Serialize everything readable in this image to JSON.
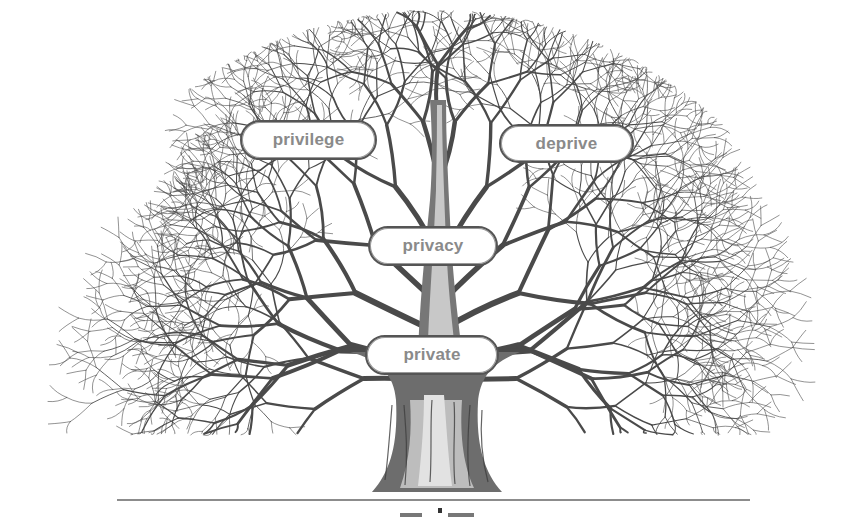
{
  "diagram": {
    "type": "word-family-tree",
    "labels": {
      "privilege": "privilege",
      "deprive": "deprive",
      "privacy": "privacy",
      "private": "private"
    },
    "nodes": [
      {
        "id": "privilege",
        "text": "privilege",
        "x": 240,
        "y": 120,
        "w": 137,
        "h": 40
      },
      {
        "id": "deprive",
        "text": "deprive",
        "x": 499,
        "y": 124,
        "w": 135,
        "h": 39
      },
      {
        "id": "privacy",
        "text": "privacy",
        "x": 368,
        "y": 226,
        "w": 130,
        "h": 40
      },
      {
        "id": "private",
        "text": "private",
        "x": 365,
        "y": 335,
        "w": 134,
        "h": 40
      }
    ],
    "colors": {
      "branch": "#4a4a4a",
      "branch_light": "#9a9a9a",
      "label_text": "#8a8a8a",
      "label_border": "#555555",
      "ground": "#8c8c8c",
      "background": "#ffffff"
    }
  }
}
